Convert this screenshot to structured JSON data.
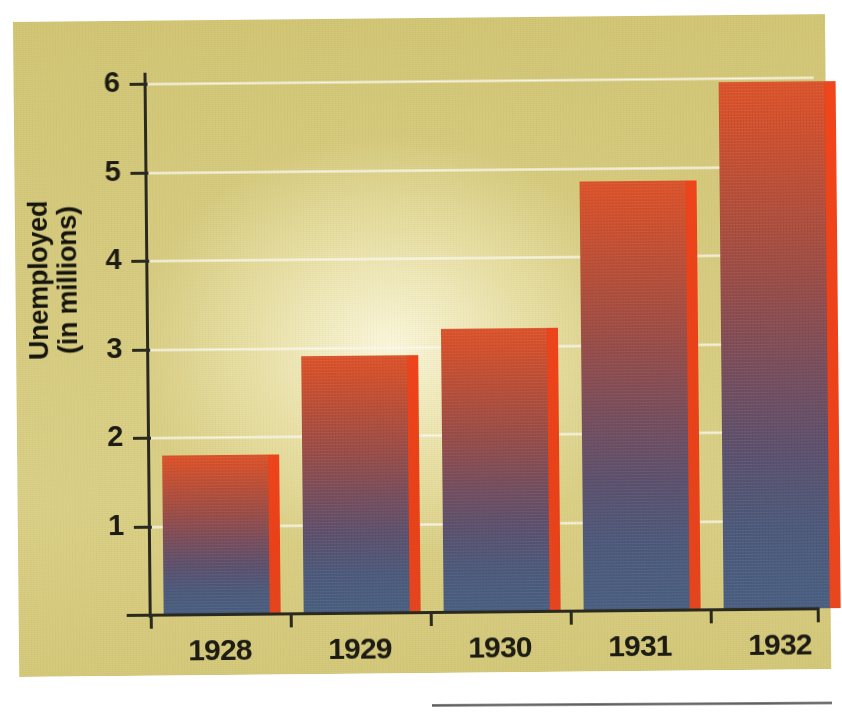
{
  "chart_data": {
    "type": "bar",
    "title": "",
    "subtitle": "",
    "xlabel": "",
    "ylabel": "Unemployed\n(in millions)",
    "ylabel_line1": "Unemployed",
    "ylabel_line2": "(in millions)",
    "categories": [
      "1928",
      "1929",
      "1930",
      "1931",
      "1932"
    ],
    "values": [
      1.8,
      2.9,
      3.2,
      4.85,
      5.95
    ],
    "series": [
      {
        "name": "Unemployed (in millions)",
        "values": [
          1.8,
          2.9,
          3.2,
          4.85,
          5.95
        ]
      }
    ],
    "ylim": [
      0,
      6.4
    ],
    "ytick_labels": [
      "6",
      "5",
      "4",
      "3",
      "2",
      "1"
    ],
    "ytick_values": [
      6,
      5,
      4,
      3,
      2,
      1
    ],
    "grid": true,
    "grid_orientation": "horizontal",
    "legend": false,
    "legend_position": "none",
    "units": "millions of people",
    "annotations": []
  },
  "style": {
    "background_color": "#d9ce84",
    "panel_highlight_color": "#fdf6cf",
    "gridline_color": "#fdfbf0",
    "axis_color": "#2a2a20",
    "tick_label_color": "#1c1c14",
    "bar_top_color": "#e0542c",
    "bar_bottom_color": "#4a6085",
    "bar_edge_color": "#ee4318",
    "rule_color": "#5e5e5e"
  }
}
